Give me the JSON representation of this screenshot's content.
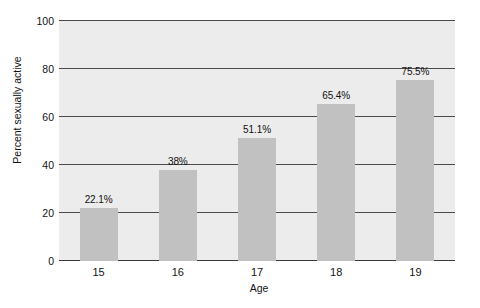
{
  "chart_data": {
    "type": "bar",
    "title": "",
    "subtitle": "",
    "xlabel": "Age",
    "ylabel": "Percent sexually active",
    "categories": [
      "15",
      "16",
      "17",
      "18",
      "19"
    ],
    "values": [
      22.1,
      38,
      51.1,
      65.4,
      75.5
    ],
    "data_labels": [
      "22.1%",
      "38%",
      "51.1%",
      "65.4%",
      "75.5%"
    ],
    "ylim": [
      0,
      100
    ],
    "yticks": [
      0,
      20,
      40,
      60,
      80,
      100
    ],
    "ytick_labels": [
      "0",
      "20",
      "40",
      "60",
      "80",
      "100"
    ],
    "grid": true,
    "grid_axis": "y",
    "legend": false,
    "legend_position": "none",
    "series": [
      {
        "name": "Percent sexually active",
        "values": [
          22.1,
          38,
          51.1,
          65.4,
          75.5
        ]
      }
    ],
    "colors": {
      "bar_fill": "#c1c1c1",
      "plot_background": "#ececec",
      "gridline": "#4a4a4a",
      "text": "#141414",
      "figure_background": "#ffffff"
    }
  }
}
